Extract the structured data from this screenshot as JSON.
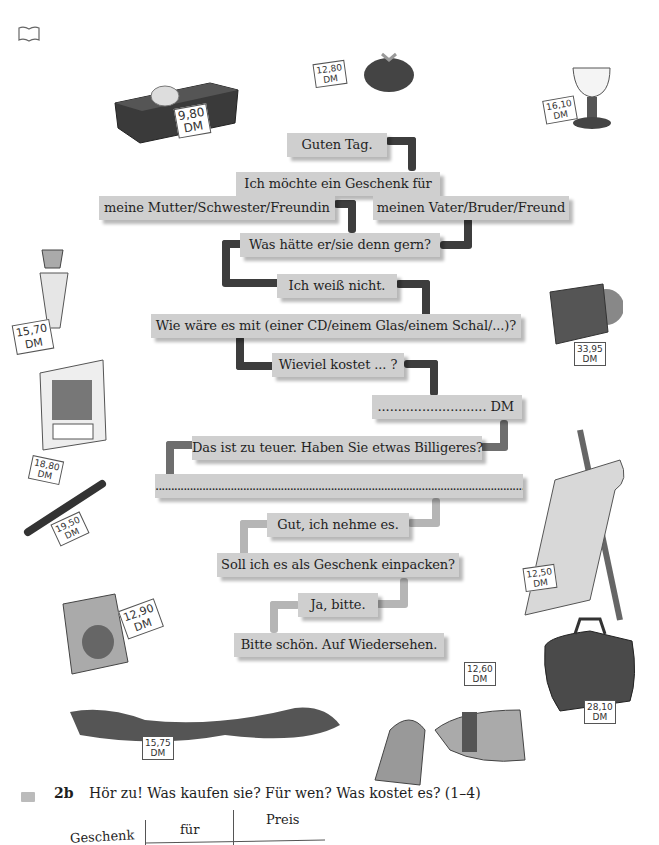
{
  "icons": {
    "book": "book-icon",
    "tape": "cassette-icon"
  },
  "dialogue": {
    "guten_tag": "Guten Tag.",
    "ich_moechte": "Ich möchte ein Geschenk für",
    "mutter": "meine Mutter/Schwester/Freundin",
    "vater": "meinen Vater/Bruder/Freund",
    "was_haette": "Was hätte er/sie denn gern?",
    "weiss_nicht": "Ich weiß nicht.",
    "wie_waere": "Wie wäre es mit (einer CD/einem Glas/einem Schal/...)?",
    "wieviel": "Wieviel kostet ... ?",
    "preis_dm": "........................... DM",
    "zu_teuer": "Das ist zu teuer. Haben Sie etwas Billigeres?",
    "blank": ".........................................................................................................................",
    "gut": "Gut, ich nehme es.",
    "einpacken": "Soll ich es als Geschenk einpacken?",
    "ja_bitte": "Ja, bitte.",
    "bitte_schoen": "Bitte schön. Auf Wiedersehen."
  },
  "price_tags": {
    "chocolates": [
      "9,80",
      "DM"
    ],
    "purse": [
      "12,80",
      "DM"
    ],
    "glass": [
      "16,10",
      "DM"
    ],
    "perfume": [
      "15,70",
      "DM"
    ],
    "calendar": [
      "18,80",
      "DM"
    ],
    "pen": [
      "19,50",
      "DM"
    ],
    "cd": [
      "33,95",
      "DM"
    ],
    "poster": [
      "12,50",
      "DM"
    ],
    "book": [
      "12,90",
      "DM"
    ],
    "scarf": [
      "15,75",
      "DM"
    ],
    "gloves": [
      "12,60",
      "DM"
    ],
    "bag": [
      "28,10",
      "DM"
    ]
  },
  "exercise": {
    "number": "2b",
    "instruction": "Hör zu! Was kaufen sie? Für wen? Was kostet es? (1–4)",
    "columns": [
      "Geschenk",
      "für",
      "Preis"
    ]
  }
}
